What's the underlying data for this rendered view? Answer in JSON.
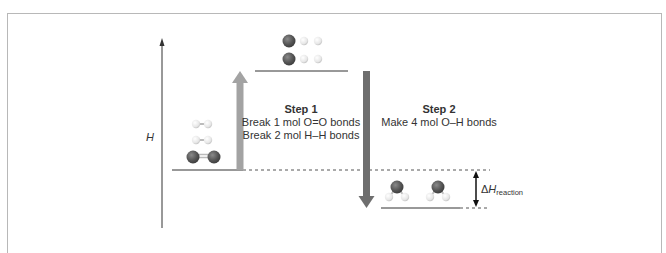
{
  "diagram": {
    "axis": {
      "label": "H"
    },
    "step1": {
      "heading": "Step 1",
      "line1": "Break 1 mol O=O bonds",
      "line2": "Break 2 mol H–H bonds",
      "arrow_color": "#a3a3a3"
    },
    "step2": {
      "heading": "Step 2",
      "line1": "Make 4 mol O–H bonds",
      "arrow_color": "#6e6e6e"
    },
    "delta": {
      "symbol": "Δ",
      "main": "H",
      "subscript": "reaction"
    },
    "levels": {
      "reactants": "2 H2 + O2",
      "atoms": "4 H + 2 O",
      "products": "2 H2O"
    },
    "colors": {
      "oxygen": "#555555",
      "hydrogen": "#e8e8e8",
      "level_line": "#333333",
      "frame": "#b8b8b8"
    }
  }
}
